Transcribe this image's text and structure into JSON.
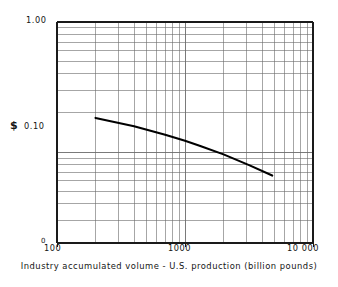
{
  "chart_data": {
    "type": "line",
    "title": "",
    "xlabel": "Industry accumulated volume - U.S. production (billion pounds)",
    "ylabel": "$",
    "xscale": "log",
    "yscale": "log",
    "xlim": [
      100,
      10000
    ],
    "ylim": [
      0.02,
      1.0
    ],
    "grid": true,
    "legend": false,
    "x_tick_labels": [
      "100",
      "1000",
      "10 000"
    ],
    "x_tick_values": [
      100,
      1000,
      10000
    ],
    "y_tick_labels": [
      "1.00",
      "0.10"
    ],
    "y_tick_values": [
      1.0,
      0.1
    ],
    "y_origin_label": "0",
    "series": [
      {
        "name": "Price per pound",
        "x": [
          200,
          400,
          700,
          1000,
          1300,
          2000,
          3200,
          4800
        ],
        "y": [
          0.183,
          0.158,
          0.136,
          0.122,
          0.112,
          0.096,
          0.079,
          0.066
        ]
      }
    ],
    "annotations": []
  },
  "axis": {
    "y_top": "1.00",
    "y_mid": "0.10",
    "y_zero": "0",
    "y_title": "$",
    "x_left": "100",
    "x_mid": "1000",
    "x_right": "10 000",
    "x_title": "Industry accumulated volume - U.S. production (billion pounds)"
  },
  "colors": {
    "grid": "#6b6b6b",
    "axis": "#1a1a1a",
    "curve": "#000000",
    "background": "#ffffff"
  }
}
